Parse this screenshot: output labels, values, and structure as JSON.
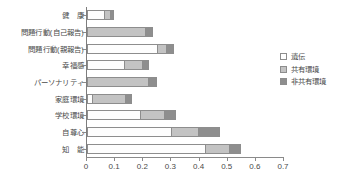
{
  "chart_data": {
    "type": "bar",
    "orientation": "horizontal",
    "stacked": true,
    "title": "",
    "subtitle": "",
    "xlabel": "",
    "ylabel": "",
    "xlim": [
      0,
      0.7
    ],
    "xticks": [
      0,
      0.1,
      0.2,
      0.3,
      0.4,
      0.5,
      0.6,
      0.7
    ],
    "xtick_labels": [
      "0",
      "0.1",
      "0.2",
      "0.3",
      "0.4",
      "0.5",
      "0.6",
      "0.7"
    ],
    "grid": false,
    "legend_position": "right",
    "categories": [
      "健　康",
      "問題行動(自己報告)",
      "問題行動(親報告)",
      "幸福感",
      "パーソナリティ",
      "家庭環境",
      "学校環境",
      "自尊心",
      "知　能"
    ],
    "series": [
      {
        "name": "遺伝",
        "color": "#ffffff",
        "values": [
          0.06,
          0.0,
          0.25,
          0.13,
          0.0,
          0.018,
          0.19,
          0.3,
          0.42
        ]
      },
      {
        "name": "共有環境",
        "color": "#c3c3c3",
        "values": [
          0.02,
          0.205,
          0.03,
          0.065,
          0.218,
          0.118,
          0.085,
          0.096,
          0.085
        ]
      },
      {
        "name": "非共有環境",
        "color": "#8e8e8e",
        "values": [
          0.015,
          0.03,
          0.03,
          0.025,
          0.032,
          0.025,
          0.043,
          0.078,
          0.043
        ]
      }
    ],
    "totals": [
      0.095,
      0.235,
      0.31,
      0.22,
      0.25,
      0.161,
      0.318,
      0.474,
      0.548
    ]
  },
  "legend": {
    "items": [
      {
        "label": "遺伝"
      },
      {
        "label": "共有環境"
      },
      {
        "label": "非共有環境"
      }
    ]
  }
}
